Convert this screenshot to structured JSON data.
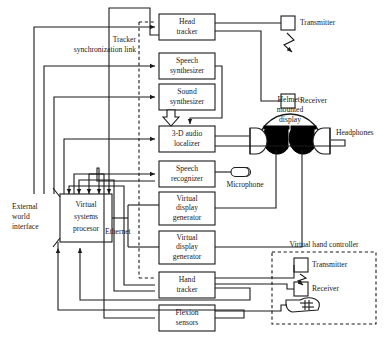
{
  "diagram": {
    "colors": {
      "line": "#1a1a1a",
      "fill": "#ffffff",
      "eyepiece": "#000000"
    },
    "blocks": [
      {
        "id": "head-tracker",
        "lines": [
          "Head",
          "tracker"
        ]
      },
      {
        "id": "speech-synthesizer",
        "lines": [
          "Speech",
          "synthesizer"
        ]
      },
      {
        "id": "sound-synthesizer",
        "lines": [
          "Sound",
          "synthesizer"
        ]
      },
      {
        "id": "audio-localizer",
        "lines": [
          "3-D audio",
          "localizer"
        ]
      },
      {
        "id": "speech-recognizer",
        "lines": [
          "Speech",
          "recognizer"
        ]
      },
      {
        "id": "display-generator-1",
        "lines": [
          "Virtual",
          "display",
          "generator"
        ]
      },
      {
        "id": "display-generator-2",
        "lines": [
          "Virtual",
          "display",
          "generator"
        ]
      },
      {
        "id": "hand-tracker",
        "lines": [
          "Hand",
          "tracker"
        ]
      },
      {
        "id": "flexion-sensors",
        "lines": [
          "Flexion",
          "sensors"
        ]
      },
      {
        "id": "virtual-systems-processor",
        "lines": [
          "Virtual",
          "systems",
          "procesor"
        ]
      }
    ],
    "labels": {
      "tracker_sync_line1": "Tracker",
      "tracker_sync_line2": "synchronization link",
      "external_world_line1": "External",
      "external_world_line2": "world",
      "external_world_line3": "interface",
      "ethernet": "Ethernet",
      "transmitter_top": "Transmitter",
      "receiver_top": "Receiver",
      "helmet_line1": "Helmet-",
      "helmet_line2": "mounted",
      "helmet_line3": "display",
      "headphones": "Headphones",
      "microphone": "Microphone",
      "virtual_hand_controller": "Virtual hand controller",
      "transmitter_hand": "Transmitter",
      "receiver_hand": "Receiver"
    }
  }
}
